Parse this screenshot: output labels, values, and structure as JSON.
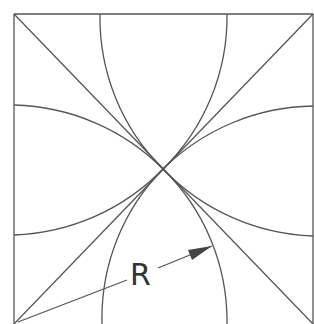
{
  "diagram": {
    "type": "geometric construction",
    "square": {
      "x": 14,
      "y": 14,
      "size": 299
    },
    "center": {
      "x": 163,
      "y": 169
    },
    "radius": 216,
    "label": "R",
    "colors": {
      "stroke": "#555555",
      "text": "#333333",
      "background": "#ffffff"
    }
  }
}
